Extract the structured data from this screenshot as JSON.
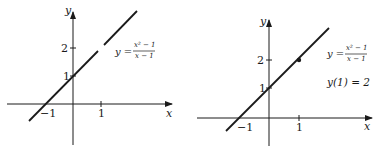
{
  "panels": [
    {
      "id": "left",
      "axes": {
        "x_label": "x",
        "y_label": "y"
      },
      "ticks": {
        "x": [
          "−1",
          "1"
        ],
        "y": [
          "1",
          "2"
        ]
      },
      "equation": {
        "lhs": "y =",
        "num": "x² − 1",
        "den": "x − 1"
      },
      "note": "",
      "hole_at": "(1, 2)"
    },
    {
      "id": "right",
      "axes": {
        "x_label": "x",
        "y_label": "y"
      },
      "ticks": {
        "x": [
          "−1",
          "1"
        ],
        "y": [
          "1",
          "2"
        ]
      },
      "equation": {
        "lhs": "y =",
        "num": "x² − 1",
        "den": "x − 1"
      },
      "note": "y(1) = 2",
      "point_at": "(1, 2)"
    }
  ],
  "colors": {
    "ink": "#1a1a1a",
    "background": "#ffffff"
  }
}
